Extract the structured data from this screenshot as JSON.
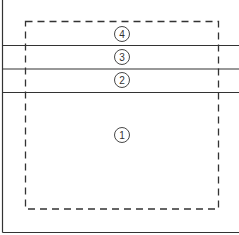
{
  "diagram": {
    "stroke_color": "#333333",
    "background": "#ffffff",
    "regions": [
      {
        "id": "1",
        "label": "1"
      },
      {
        "id": "2",
        "label": "2"
      },
      {
        "id": "3",
        "label": "3"
      },
      {
        "id": "4",
        "label": "4"
      }
    ]
  }
}
